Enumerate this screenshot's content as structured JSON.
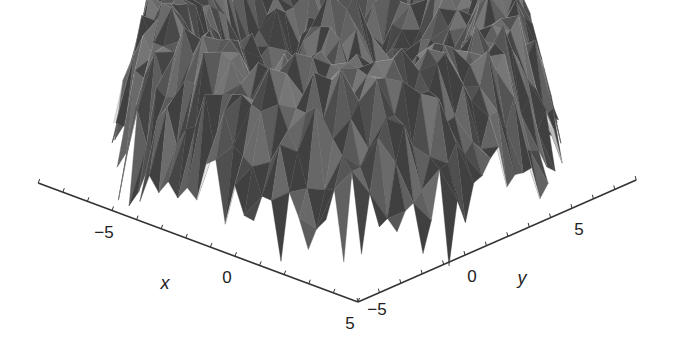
{
  "chart_data": {
    "type": "surface3d",
    "title": "",
    "xlabel": "x",
    "ylabel": "y",
    "zlabel": "",
    "xlim": [
      -8,
      5
    ],
    "ylim": [
      -5,
      8
    ],
    "x_ticks": [
      {
        "value": -5,
        "label": "−5"
      },
      {
        "value": 0,
        "label": "0"
      },
      {
        "value": 5,
        "label": "5"
      }
    ],
    "y_ticks": [
      {
        "value": -5,
        "label": "−5"
      },
      {
        "value": 0,
        "label": "0"
      },
      {
        "value": 5,
        "label": "5"
      }
    ],
    "x_minor_step": 1,
    "y_minor_step": 1,
    "surface": {
      "function": "z = cos(r) + noise, r = sqrt(x^2 + y^2)",
      "domain": [
        -8,
        8
      ],
      "grid_n": 34,
      "noise_amplitude": 0.45,
      "colormap": "gray",
      "gray_range": [
        "#2a2a2a",
        "#f0f0f0"
      ]
    },
    "grid": false,
    "legend": null
  },
  "colors": {
    "background": "#ffffff",
    "axis": "#333333",
    "text": "#222222"
  }
}
